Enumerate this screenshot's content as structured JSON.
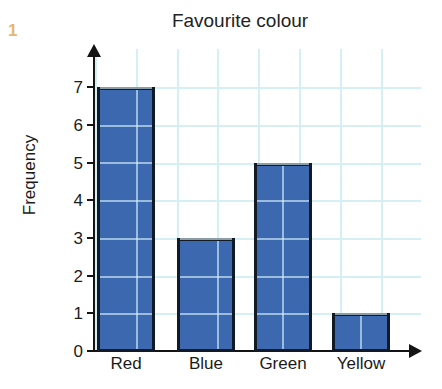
{
  "question_number": "1",
  "chart_data": {
    "type": "bar",
    "title": "Favourite colour",
    "xlabel": "",
    "ylabel": "Frequency",
    "categories": [
      "Red",
      "Blue",
      "Green",
      "Yellow"
    ],
    "values": [
      7,
      3,
      5,
      1
    ],
    "ylim": [
      0,
      7
    ],
    "ytick_labels": [
      "0",
      "1",
      "2",
      "3",
      "4",
      "5",
      "6",
      "7"
    ],
    "yticks": [
      0,
      1,
      2,
      3,
      4,
      5,
      6,
      7
    ],
    "grid": true,
    "grid_color": "#d5f0f3",
    "bar_color": "#3c68b0",
    "bar_edge_color": "#121a26",
    "axis_color": "#141414",
    "legend": null
  }
}
